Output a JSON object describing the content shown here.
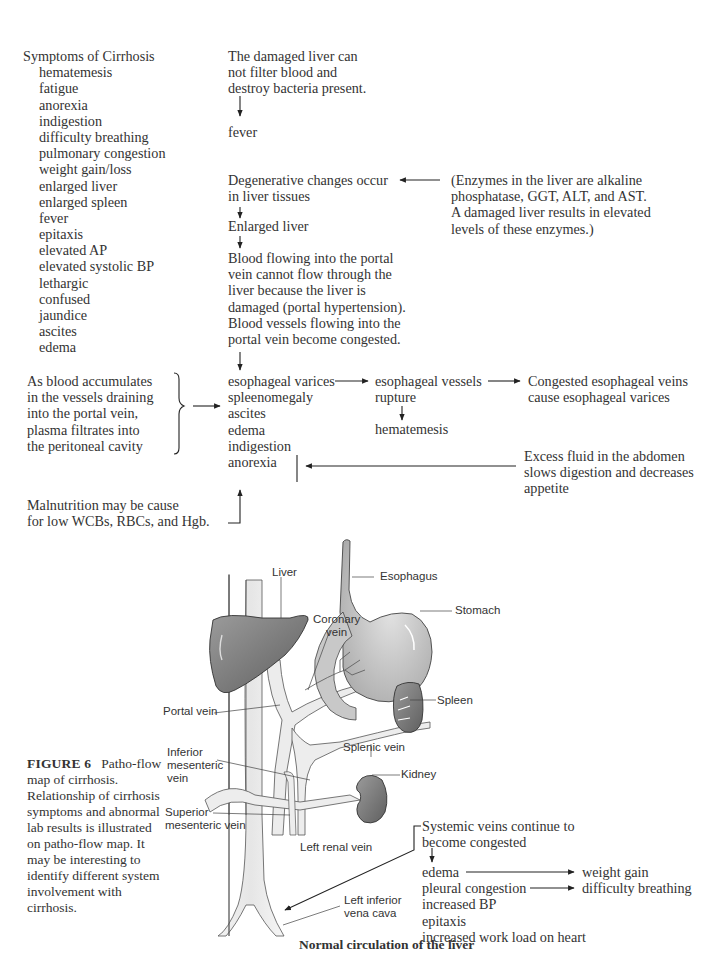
{
  "symptoms": {
    "title": "Symptoms of Cirrhosis",
    "items": [
      "hematemesis",
      "fatigue",
      "anorexia",
      "indigestion",
      "difficulty breathing",
      "pulmonary congestion",
      "weight gain/loss",
      "enlarged liver",
      "enlarged spleen",
      "fever",
      "epitaxis",
      "elevated AP",
      "elevated systolic BP",
      "lethargic",
      "confused",
      "jaundice",
      "ascites",
      "edema"
    ]
  },
  "flow": {
    "liver_filter": [
      "The damaged liver can",
      "not filter blood and",
      "destroy bacteria present."
    ],
    "fever": "fever",
    "degenerative": [
      "Degenerative changes occur",
      "in liver tissues"
    ],
    "enlarged_liver": "Enlarged liver",
    "portal": [
      "Blood flowing into the portal",
      "vein cannot flow through the",
      "liver because the liver is",
      "damaged (portal hypertension).",
      "Blood vessels flowing into the",
      "portal vein become congested."
    ],
    "enzymes": [
      "(Enzymes in the liver are alkaline",
      "phosphatase, GGT, ALT, and AST.",
      "A damaged liver results in elevated",
      "levels of these enzymes.)"
    ],
    "accumulate": [
      "As blood accumulates",
      "in the vessels draining",
      "into the portal vein,",
      "plasma filtrates into",
      "the peritoneal cavity"
    ],
    "manifestations": [
      "esophageal varices",
      "spleenomegaly",
      "ascites",
      "edema",
      "indigestion",
      "anorexia"
    ],
    "rupture": [
      "esophageal vessels",
      "rupture"
    ],
    "hematemesis": "hematemesis",
    "congested_veins": [
      "Congested esophageal veins",
      "cause esophageal varices"
    ],
    "excess_fluid": [
      "Excess fluid in the abdomen",
      "slows digestion and decreases",
      "appetite"
    ],
    "malnutrition": [
      "Malnutrition may be cause",
      "for low WCBs, RBCs, and Hgb."
    ],
    "systemic": [
      "Systemic veins continue to",
      "become congested"
    ],
    "systemic_effects": [
      "edema",
      "pleural congestion",
      "increased BP",
      "epitaxis",
      "increased work load on heart"
    ],
    "systemic_results": [
      "weight gain",
      "difficulty breathing"
    ]
  },
  "anatomy": {
    "labels": {
      "esophagus": "Esophagus",
      "liver": "Liver",
      "stomach": "Stomach",
      "coronary_vein": [
        "Coronary",
        "vein"
      ],
      "spleen": "Spleen",
      "portal_vein": "Portal vein",
      "splenic_vein": "Splenic vein",
      "inferior_mesenteric": [
        "Inferior",
        "mesenteric",
        "vein"
      ],
      "kidney": "Kidney",
      "superior_mesenteric": [
        "Superior",
        "mesenteric vein"
      ],
      "left_renal": "Left renal vein",
      "left_inferior_vena_cava": [
        "Left inferior",
        "vena cava"
      ]
    },
    "title": "Normal circulation of the liver"
  },
  "caption": {
    "label": "FIGURE 6",
    "text": "Patho-flow map of cirrhosis. Relationship of cirrhosis symptoms and abnormal lab results is illustrated on patho-flow map. It may be interesting to identify different system involvement with cirrhosis."
  }
}
